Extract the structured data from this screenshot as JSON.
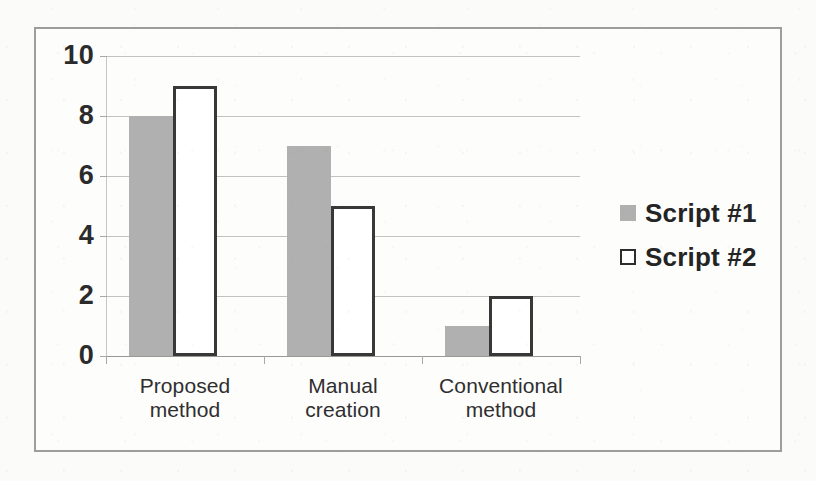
{
  "chart_data": {
    "type": "bar",
    "title": "",
    "subtitle": "",
    "xlabel": "",
    "ylabel": "",
    "categories": [
      "Proposed method",
      "Manual creation",
      "Conventional method"
    ],
    "category_lines": [
      [
        "Proposed",
        "method"
      ],
      [
        "Manual",
        "creation"
      ],
      [
        "Conventional",
        "method"
      ]
    ],
    "series": [
      {
        "name": "Script #1",
        "values": [
          8,
          7,
          1
        ],
        "color": "#b0b0b0",
        "style": "filled-gray"
      },
      {
        "name": "Script #2",
        "values": [
          9,
          5,
          2
        ],
        "color": "#ffffff",
        "style": "white-outlined"
      }
    ],
    "ylim": [
      0,
      10
    ],
    "y_ticks": [
      0,
      2,
      4,
      6,
      8,
      10
    ],
    "y_tick_labels": [
      "0",
      "2",
      "4",
      "6",
      "8",
      "10"
    ],
    "grid": true,
    "grid_axis": "y",
    "legend": true,
    "legend_position": "right"
  },
  "legend": {
    "entries": [
      {
        "label": "Script #1",
        "marker": "filled-square-gray"
      },
      {
        "label": "Script #2",
        "marker": "outlined-square-white"
      }
    ]
  },
  "colors": {
    "series_1_fill": "#b0b0b0",
    "series_2_fill": "#ffffff",
    "series_2_border": "#383838",
    "gridline": "#c2c2c2",
    "frame_border": "#9d9d9d",
    "page_background": "#fbfbfa",
    "text": "#2b2b2b"
  }
}
